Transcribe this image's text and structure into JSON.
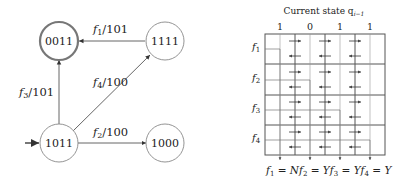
{
  "state_diagram": {
    "states": [
      {
        "id": "s0011",
        "label": "0011",
        "accepting": true
      },
      {
        "id": "s1111",
        "label": "1111",
        "accepting": false
      },
      {
        "id": "s1011",
        "label": "1011",
        "initial": true
      },
      {
        "id": "s1000",
        "label": "1000",
        "accepting": false
      }
    ],
    "transitions": [
      {
        "from": "1111",
        "to": "0011",
        "fn": "f",
        "sub": "1",
        "out": "/101"
      },
      {
        "from": "1011",
        "to": "0011",
        "fn": "f",
        "sub": "3",
        "out": "/101"
      },
      {
        "from": "1011",
        "to": "1111",
        "fn": "f",
        "sub": "4",
        "out": "/100"
      },
      {
        "from": "1011",
        "to": "1000",
        "fn": "f",
        "sub": "2",
        "out": "/100"
      }
    ]
  },
  "grid": {
    "title": "Current state q",
    "title_sub": "i−1",
    "column_bits": [
      "1",
      "0",
      "1",
      "1"
    ],
    "row_labels": [
      {
        "fn": "f",
        "sub": "1"
      },
      {
        "fn": "f",
        "sub": "2"
      },
      {
        "fn": "f",
        "sub": "3"
      },
      {
        "fn": "f",
        "sub": "4"
      }
    ],
    "footer": [
      {
        "fn": "f",
        "sub": "1",
        "val": " = N"
      },
      {
        "fn": "f",
        "sub": "2",
        "val": " = Y"
      },
      {
        "fn": "f",
        "sub": "3",
        "val": " = Y"
      },
      {
        "fn": "f",
        "sub": "4",
        "val": " = Y"
      }
    ]
  }
}
